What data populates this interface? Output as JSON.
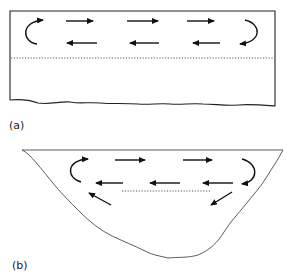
{
  "figure": {
    "panels": [
      {
        "id": "a",
        "label": "(a)",
        "shape": "rectangular basin",
        "circulation": {
          "upper_flow": "rightward",
          "lower_flow": "leftward",
          "arrows_right": 3,
          "arrows_left": 3,
          "end_curls": [
            "left (counter, turning up-right)",
            "right (turning down-left)"
          ]
        },
        "dotted_line": "boundary below circulation cell"
      },
      {
        "id": "b",
        "label": "(b)",
        "shape": "V-shaped basin",
        "circulation": {
          "upper_flow": "rightward",
          "lower_flow": "leftward",
          "arrows_right": 2,
          "arrows_left": 3,
          "diagonal_arrows": [
            "left: up-left along slope",
            "right: down-left along slope"
          ],
          "end_curls": [
            "left",
            "right"
          ]
        },
        "dotted_line": "short boundary below circulation cell"
      }
    ],
    "colors": {
      "ink": "#222222",
      "background": "#ffffff"
    }
  }
}
